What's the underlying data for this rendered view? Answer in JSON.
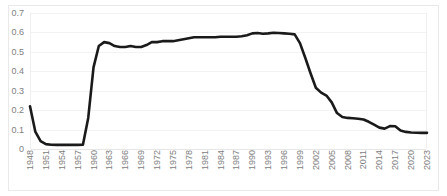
{
  "chart_data": {
    "type": "line",
    "title": "",
    "subtitle": "",
    "xlabel": "",
    "ylabel": "",
    "ylim": [
      0,
      0.7
    ],
    "xlim": [
      1948,
      2023
    ],
    "grid": true,
    "legend": "none",
    "y_ticks": [
      "0.7",
      "0.6",
      "0.5",
      "0.4",
      "0.3",
      "0.2",
      "0.1",
      "0"
    ],
    "y_tick_values": [
      0.7,
      0.6,
      0.5,
      0.4,
      0.3,
      0.2,
      0.1,
      0
    ],
    "x_ticks": [
      "1948",
      "1951",
      "1954",
      "1957",
      "1960",
      "1963",
      "1966",
      "1969",
      "1972",
      "1975",
      "1978",
      "1981",
      "1984",
      "1987",
      "1990",
      "1993",
      "1996",
      "1999",
      "2002",
      "2005",
      "2008",
      "2011",
      "2014",
      "2017",
      "2020",
      "2023"
    ],
    "line_color": "#1a1a1a",
    "line_width": 2.6,
    "grid_color": "#f2f2f2",
    "series": [
      {
        "name": "series-1",
        "x": [
          1948,
          1949,
          1950,
          1951,
          1952,
          1953,
          1954,
          1955,
          1956,
          1957,
          1958,
          1959,
          1960,
          1961,
          1962,
          1963,
          1964,
          1965,
          1966,
          1967,
          1968,
          1969,
          1970,
          1971,
          1972,
          1973,
          1974,
          1975,
          1976,
          1977,
          1978,
          1979,
          1980,
          1981,
          1982,
          1983,
          1984,
          1985,
          1986,
          1987,
          1988,
          1989,
          1990,
          1991,
          1992,
          1993,
          1994,
          1995,
          1996,
          1997,
          1998,
          1999,
          2000,
          2001,
          2002,
          2003,
          2004,
          2005,
          2006,
          2007,
          2008,
          2009,
          2010,
          2011,
          2012,
          2013,
          2014,
          2015,
          2016,
          2017,
          2018,
          2019,
          2020,
          2021,
          2022,
          2023
        ],
        "values": [
          0.22,
          0.09,
          0.04,
          0.025,
          0.022,
          0.021,
          0.021,
          0.021,
          0.021,
          0.021,
          0.022,
          0.16,
          0.42,
          0.53,
          0.55,
          0.545,
          0.53,
          0.525,
          0.525,
          0.53,
          0.525,
          0.525,
          0.535,
          0.55,
          0.55,
          0.555,
          0.555,
          0.555,
          0.56,
          0.565,
          0.57,
          0.575,
          0.575,
          0.575,
          0.575,
          0.575,
          0.578,
          0.578,
          0.578,
          0.578,
          0.58,
          0.585,
          0.595,
          0.597,
          0.593,
          0.595,
          0.598,
          0.597,
          0.595,
          0.593,
          0.59,
          0.545,
          0.47,
          0.39,
          0.315,
          0.29,
          0.275,
          0.24,
          0.185,
          0.165,
          0.16,
          0.158,
          0.156,
          0.152,
          0.14,
          0.125,
          0.11,
          0.105,
          0.118,
          0.117,
          0.095,
          0.088,
          0.085,
          0.084,
          0.083,
          0.083
        ]
      }
    ]
  }
}
